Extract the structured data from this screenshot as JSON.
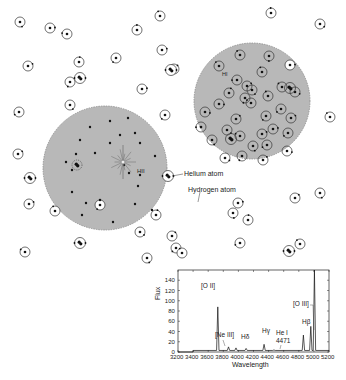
{
  "diagram": {
    "regions": [
      {
        "id": "hii-region",
        "label": "HII",
        "cx": 105,
        "cy": 168,
        "r": 62,
        "fill": "#b8b8b8"
      },
      {
        "id": "hi-region",
        "label": "HI",
        "cx": 252,
        "cy": 101,
        "r": 58,
        "fill": "#b8b8b8"
      }
    ],
    "annotations": {
      "helium_atom": "Helium atom",
      "hydrogen_atom": "Hydrogen atom"
    },
    "colors": {
      "region_fill": "#b8b8b8",
      "region_edge": "#8a8a8a",
      "atom_stroke": "#333333",
      "nucleus": "#111111",
      "star": "#777777"
    },
    "free_hydrogen_atoms": [
      [
        20,
        22
      ],
      [
        67,
        34
      ],
      [
        137,
        30
      ],
      [
        160,
        16
      ],
      [
        28,
        66
      ],
      [
        79,
        62
      ],
      [
        116,
        58
      ],
      [
        162,
        50
      ],
      [
        174,
        69
      ],
      [
        142,
        89
      ],
      [
        70,
        82
      ],
      [
        70,
        105
      ],
      [
        19,
        112
      ],
      [
        165,
        115
      ],
      [
        18,
        154
      ],
      [
        29,
        204
      ],
      [
        55,
        211
      ],
      [
        100,
        205
      ],
      [
        25,
        252
      ],
      [
        271,
        13
      ],
      [
        320,
        24
      ],
      [
        290,
        65
      ],
      [
        330,
        117
      ],
      [
        147,
        258
      ],
      [
        238,
        203
      ],
      [
        295,
        198
      ],
      [
        320,
        193
      ],
      [
        172,
        236
      ],
      [
        176,
        248
      ],
      [
        182,
        253
      ],
      [
        140,
        232
      ],
      [
        156,
        215
      ],
      [
        248,
        220
      ],
      [
        233,
        213
      ],
      [
        300,
        244
      ],
      [
        240,
        243
      ],
      [
        50,
        28
      ]
    ],
    "free_helium_atoms": [
      [
        80,
        78
      ],
      [
        171,
        70
      ],
      [
        30,
        178
      ],
      [
        80,
        243
      ],
      [
        168,
        176
      ],
      [
        289,
        251
      ]
    ],
    "hi_interior_atoms": [
      [
        219,
        66
      ],
      [
        240,
        55
      ],
      [
        269,
        56
      ],
      [
        262,
        72
      ],
      [
        237,
        80
      ],
      [
        247,
        86
      ],
      [
        229,
        93
      ],
      [
        251,
        103
      ],
      [
        219,
        104
      ],
      [
        245,
        98
      ],
      [
        282,
        87
      ],
      [
        266,
        116
      ],
      [
        281,
        109
      ],
      [
        295,
        92
      ],
      [
        291,
        118
      ],
      [
        273,
        129
      ],
      [
        236,
        119
      ],
      [
        227,
        130
      ],
      [
        240,
        136
      ],
      [
        253,
        146
      ],
      [
        267,
        145
      ],
      [
        288,
        133
      ],
      [
        212,
        140
      ],
      [
        225,
        158
      ],
      [
        263,
        160
      ],
      [
        287,
        151
      ],
      [
        252,
        90
      ],
      [
        268,
        96
      ],
      [
        262,
        134
      ],
      [
        205,
        112
      ],
      [
        201,
        127
      ],
      [
        242,
        156
      ]
    ],
    "hi_interior_helium": [
      [
        290,
        88
      ],
      [
        231,
        139
      ]
    ],
    "hii_dots": [
      [
        90,
        127
      ],
      [
        110,
        121
      ],
      [
        128,
        118
      ],
      [
        120,
        135
      ],
      [
        80,
        140
      ],
      [
        76,
        154
      ],
      [
        95,
        153
      ],
      [
        66,
        162
      ],
      [
        110,
        143
      ],
      [
        140,
        143
      ],
      [
        155,
        156
      ],
      [
        129,
        173
      ],
      [
        140,
        175
      ],
      [
        138,
        186
      ],
      [
        72,
        192
      ],
      [
        86,
        203
      ],
      [
        100,
        200
      ],
      [
        82,
        215
      ],
      [
        113,
        222
      ],
      [
        135,
        204
      ],
      [
        152,
        210
      ],
      [
        72,
        170
      ],
      [
        124,
        165
      ],
      [
        135,
        133
      ]
    ],
    "hii_helium": [
      [
        77,
        165
      ]
    ],
    "star": {
      "cx": 123,
      "cy": 162,
      "rays": 14,
      "len": 13
    }
  },
  "chart_data": {
    "type": "line",
    "title": "",
    "xlabel": "Wavelength",
    "ylabel": "Flux",
    "xlim": [
      3200,
      5200
    ],
    "ylim": [
      0,
      160
    ],
    "x_ticks": [
      3200,
      3400,
      3600,
      3800,
      4000,
      4200,
      4400,
      4600,
      4800,
      5000,
      5200
    ],
    "y_ticks": [
      0,
      20,
      40,
      60,
      80,
      100,
      120,
      140
    ],
    "grid": false,
    "legend": null,
    "series": [
      {
        "name": "Emission spectrum",
        "continuum": 3,
        "lines": [
          {
            "label": "[O II]",
            "wavelength": 3727,
            "flux": 88
          },
          {
            "label": "[Ne III]",
            "wavelength": 3869,
            "flux": 10
          },
          {
            "label": "",
            "wavelength": 3968,
            "flux": 8
          },
          {
            "label": "Hδ",
            "wavelength": 4102,
            "flux": 7
          },
          {
            "label": "Hγ",
            "wavelength": 4340,
            "flux": 15
          },
          {
            "label": "He I 4471",
            "wavelength": 4471,
            "flux": 4
          },
          {
            "label": "Hβ",
            "wavelength": 4861,
            "flux": 33
          },
          {
            "label": "[O III]",
            "wavelength": 4959,
            "flux": 50
          },
          {
            "label": "[O III]",
            "wavelength": 5007,
            "flux": 160
          }
        ]
      }
    ],
    "peak_labels": {
      "oii": "[O II]",
      "neiii": "[Ne III]",
      "hdelta": "Hδ",
      "hgamma": "Hγ",
      "hei": "He I",
      "hei_wl": "4471",
      "hbeta": "Hβ",
      "oiii": "[O III]"
    }
  }
}
